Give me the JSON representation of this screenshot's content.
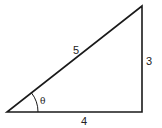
{
  "diagram": {
    "type": "right-triangle",
    "stroke_color": "#1a1a1a",
    "background": "#ffffff",
    "vertices": {
      "left": [
        7,
        112
      ],
      "bottom_right": [
        142,
        112
      ],
      "top_right": [
        142,
        6
      ]
    },
    "labels": {
      "hypotenuse": "5",
      "opposite": "3",
      "adjacent": "4",
      "angle": "θ"
    }
  }
}
